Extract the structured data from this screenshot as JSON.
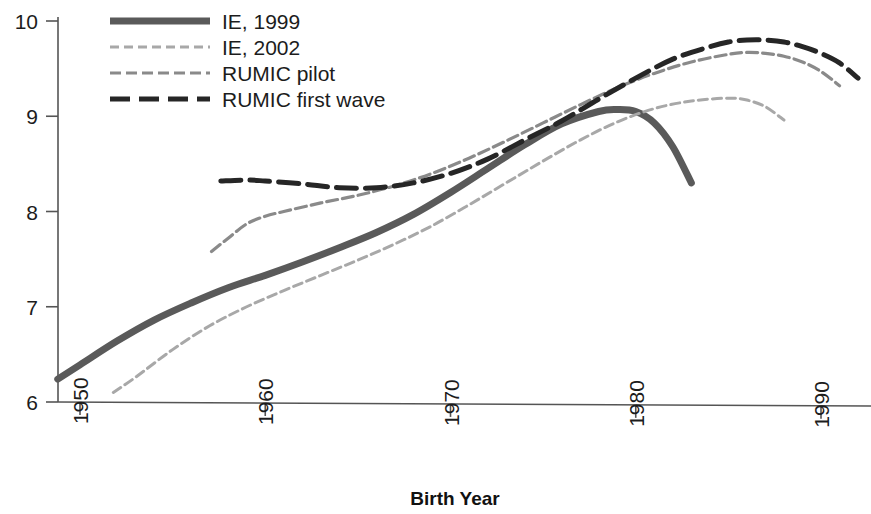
{
  "chart_data": {
    "type": "line",
    "title": "",
    "xlabel": "Birth Year",
    "ylabel": "",
    "xlim": [
      1946,
      1994
    ],
    "ylim": [
      6,
      10
    ],
    "xticks": [
      1950,
      1960,
      1970,
      1980,
      1990
    ],
    "xtick_labels": [
      "1950",
      "1960",
      "1970",
      "1980",
      "1990"
    ],
    "yticks": [
      6,
      7,
      8,
      9,
      10
    ],
    "ytick_labels": [
      "6",
      "7",
      "8",
      "9",
      "10"
    ],
    "grid": false,
    "legend_position": "top-left",
    "series": [
      {
        "name": "IE, 1999",
        "color": "#5a5a5a",
        "style": "solid",
        "width": 7,
        "x": [
          1948.8,
          1950,
          1952,
          1954,
          1956,
          1958,
          1960,
          1962,
          1964,
          1966,
          1968,
          1970,
          1972,
          1974,
          1976,
          1978,
          1979,
          1980,
          1981,
          1982,
          1983
        ],
        "y": [
          6.24,
          6.39,
          6.64,
          6.86,
          7.04,
          7.2,
          7.33,
          7.47,
          7.62,
          7.78,
          7.97,
          8.2,
          8.45,
          8.7,
          8.92,
          9.05,
          9.07,
          9.05,
          8.93,
          8.68,
          8.3
        ]
      },
      {
        "name": "IE, 2002",
        "color": "#a8a8a8",
        "style": "dash-fine",
        "width": 3,
        "x": [
          1951.8,
          1953,
          1955,
          1957,
          1959,
          1961,
          1963,
          1965,
          1967,
          1969,
          1971,
          1973,
          1975,
          1977,
          1979,
          1981,
          1983,
          1985,
          1986,
          1987,
          1988
        ],
        "y": [
          6.1,
          6.26,
          6.55,
          6.8,
          7.0,
          7.17,
          7.33,
          7.49,
          7.66,
          7.85,
          8.07,
          8.3,
          8.53,
          8.75,
          8.94,
          9.08,
          9.16,
          9.19,
          9.17,
          9.1,
          8.96
        ]
      },
      {
        "name": "RUMIC pilot",
        "color": "#8a8a8a",
        "style": "dash-short",
        "width": 3.2,
        "x": [
          1957.1,
          1958,
          1959,
          1960,
          1961,
          1963,
          1965,
          1967,
          1969,
          1971,
          1973,
          1975,
          1977,
          1979,
          1981,
          1983,
          1985,
          1986,
          1987,
          1988,
          1989,
          1990,
          1991
        ],
        "y": [
          7.58,
          7.72,
          7.87,
          7.95,
          8.0,
          8.09,
          8.17,
          8.27,
          8.4,
          8.56,
          8.74,
          8.93,
          9.12,
          9.3,
          9.45,
          9.57,
          9.65,
          9.67,
          9.66,
          9.63,
          9.57,
          9.47,
          9.32
        ]
      },
      {
        "name": "RUMIC first wave",
        "color": "#262626",
        "style": "dash-long",
        "width": 5,
        "x": [
          1957.6,
          1959,
          1960,
          1962,
          1964,
          1966,
          1968,
          1970,
          1972,
          1974,
          1976,
          1978,
          1980,
          1982,
          1984,
          1985,
          1986,
          1987,
          1988,
          1989,
          1990,
          1991,
          1992
        ],
        "y": [
          8.32,
          8.33,
          8.32,
          8.29,
          8.25,
          8.25,
          8.3,
          8.4,
          8.55,
          8.75,
          8.95,
          9.18,
          9.4,
          9.6,
          9.73,
          9.78,
          9.8,
          9.8,
          9.78,
          9.73,
          9.66,
          9.56,
          9.4
        ]
      }
    ]
  },
  "legend": {
    "items": [
      {
        "label": "IE, 1999"
      },
      {
        "label": "IE, 2002"
      },
      {
        "label": "RUMIC pilot"
      },
      {
        "label": "RUMIC first wave"
      }
    ]
  }
}
